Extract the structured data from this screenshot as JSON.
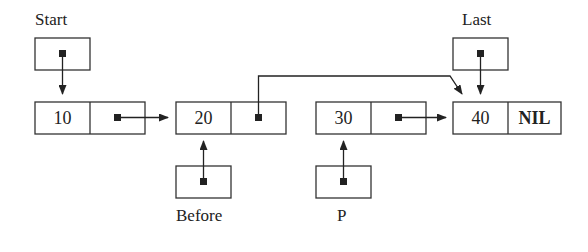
{
  "diagram": {
    "type": "singly-linked-list",
    "pointers": {
      "start": {
        "label": "Start",
        "points_to": "node_10"
      },
      "last": {
        "label": "Last",
        "points_to": "node_40"
      },
      "before": {
        "label": "Before",
        "points_to": "node_20"
      },
      "p": {
        "label": "P",
        "points_to": "node_30"
      }
    },
    "nodes": [
      {
        "id": "node_10",
        "value": "10",
        "next": "node_20"
      },
      {
        "id": "node_20",
        "value": "20",
        "next": "node_40"
      },
      {
        "id": "node_30",
        "value": "30",
        "next": "node_40"
      },
      {
        "id": "node_40",
        "value": "40",
        "next": "NIL"
      }
    ],
    "nil_label": "NIL"
  }
}
